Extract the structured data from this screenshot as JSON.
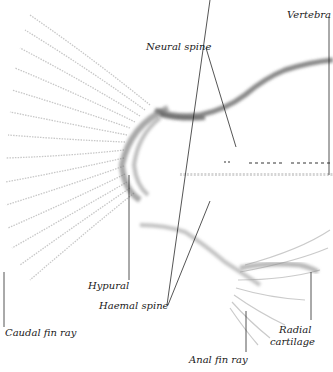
{
  "figure": {
    "colors": {
      "background": "#ffffff",
      "bone": "#6e6e6e",
      "bone_light": "#b8b8b8",
      "leader_line": "#2a2a2a",
      "label_text": "#1a1a1a"
    }
  },
  "labels": {
    "vertebra": "Vertebra",
    "neural_spine": "Neural spine",
    "hypural": "Hypural",
    "haemal_spine": "Haemal  spine",
    "caudal_fin_ray": "Caudal fin ray",
    "radial_cartilage_line1": "Radial",
    "radial_cartilage_line2": "cartilage",
    "anal_fin_ray": "Anal fin ray"
  }
}
